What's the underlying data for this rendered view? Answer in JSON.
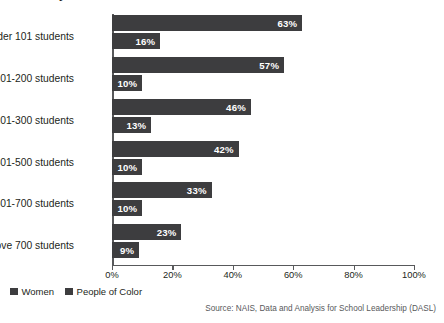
{
  "chart_data": {
    "type": "bar",
    "orientation": "horizontal",
    "title": "by Number of Students",
    "categories": [
      "Under 101 students",
      "101-200 students",
      "201-300 students",
      "301-500 students",
      "501-700 students",
      "Above 700 students"
    ],
    "series": [
      {
        "name": "Women",
        "color": "#3d3d3f",
        "values": [
          63,
          57,
          46,
          42,
          33,
          23
        ],
        "labels": [
          "63%",
          "57%",
          "46%",
          "42%",
          "33%",
          "23%"
        ]
      },
      {
        "name": "People of Color",
        "color": "#3d3d3f",
        "values": [
          16,
          10,
          13,
          10,
          10,
          9
        ],
        "labels": [
          "16%",
          "10%",
          "13%",
          "10%",
          "10%",
          "9%"
        ]
      }
    ],
    "xlabel": "",
    "ylabel": "",
    "xlim": [
      0,
      100
    ],
    "xticks": [
      0,
      20,
      40,
      60,
      80,
      100
    ],
    "xtick_labels": [
      "0%",
      "20%",
      "40%",
      "60%",
      "80%",
      "100%"
    ],
    "grid": false,
    "legend_position": "bottom-left"
  },
  "legend": {
    "items": [
      {
        "label": "Women"
      },
      {
        "label": "People of Color"
      }
    ]
  },
  "source": {
    "text": "Source: NAIS, Data and Analysis for School Leadership (DASL)"
  }
}
